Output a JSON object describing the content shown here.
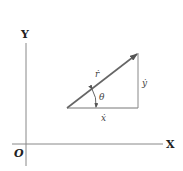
{
  "diagram": {
    "axes": {
      "x_label": "X",
      "y_label": "Y",
      "origin_label": "O"
    },
    "vector": {
      "label": "ṙ",
      "angle_label": "θ"
    },
    "components": {
      "horizontal_label": "ẋ",
      "vertical_label": "ẏ"
    },
    "colors": {
      "lines": "#6e6e6e",
      "vector": "#666666",
      "text": "#333333"
    }
  }
}
